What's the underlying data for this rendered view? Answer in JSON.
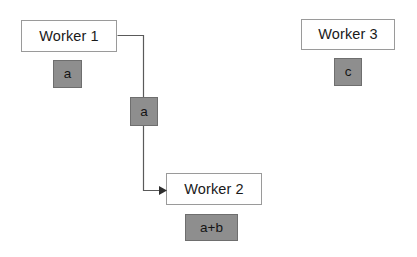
{
  "diagram": {
    "type": "flow-diagram",
    "canvas": {
      "width": 417,
      "height": 257,
      "background": "#ffffff"
    },
    "colors": {
      "node_fill": "#ffffff",
      "node_border": "#9a9a9a",
      "state_fill": "#8e8e8e",
      "state_border": "#6e6e6e",
      "edge": "#5a5a5a",
      "text": "#1a1a1a"
    },
    "nodes": [
      {
        "id": "worker1",
        "label": "Worker 1",
        "state_label": "a",
        "x": 21,
        "y": 20,
        "width": 96,
        "height": 32,
        "state_x": 53,
        "state_y": 60,
        "state_width": 29,
        "state_height": 28
      },
      {
        "id": "worker2",
        "label": "Worker 2",
        "state_label": "a+b",
        "x": 166,
        "y": 173,
        "width": 96,
        "height": 32,
        "state_x": 185,
        "state_y": 214,
        "state_width": 53,
        "state_height": 27
      },
      {
        "id": "worker3",
        "label": "Worker 3",
        "state_label": "c",
        "x": 301,
        "y": 19,
        "width": 94,
        "height": 31,
        "state_x": 334,
        "state_y": 58,
        "state_width": 28,
        "state_height": 28
      }
    ],
    "messages": [
      {
        "id": "msg-a",
        "label": "a",
        "from": "worker1",
        "to": "worker2",
        "x": 130,
        "y": 97,
        "width": 28,
        "height": 29
      }
    ],
    "edges": [
      {
        "id": "edge-worker1-worker2",
        "from": "worker1",
        "to": "worker2",
        "arrowhead": true,
        "path": "M 117.5 35.5 L 143.5 35.5 L 143.5 190.5 L 160 190.5"
      }
    ]
  }
}
